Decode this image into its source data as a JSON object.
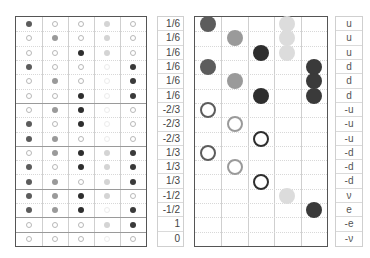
{
  "colors": {
    "col1": "#5c5c5c",
    "col2": "#9a9a9a",
    "col3": "#2e2e2e",
    "col4": "#d4d4d4",
    "col5": "#3a3a3a",
    "hollow_small": "#b8b8b8",
    "hollow_faint": "#ececec"
  },
  "left_grid": {
    "groups": [
      6,
      3,
      3,
      2,
      1,
      1
    ],
    "rows": [
      [
        1,
        0,
        0,
        1,
        0
      ],
      [
        0,
        1,
        0,
        1,
        0
      ],
      [
        0,
        0,
        1,
        1,
        0
      ],
      [
        1,
        0,
        0,
        0,
        1
      ],
      [
        0,
        1,
        0,
        0,
        1
      ],
      [
        0,
        0,
        1,
        0,
        1
      ],
      [
        0,
        1,
        1,
        0,
        0
      ],
      [
        1,
        0,
        1,
        0,
        0
      ],
      [
        1,
        1,
        0,
        0,
        0
      ],
      [
        0,
        1,
        1,
        1,
        1
      ],
      [
        1,
        0,
        1,
        1,
        1
      ],
      [
        1,
        1,
        0,
        1,
        1
      ],
      [
        1,
        1,
        1,
        1,
        0
      ],
      [
        1,
        1,
        1,
        0,
        1
      ],
      [
        0,
        0,
        0,
        1,
        1
      ],
      [
        0,
        0,
        0,
        0,
        0
      ]
    ]
  },
  "charges": [
    "1/6",
    "1/6",
    "1/6",
    "1/6",
    "1/6",
    "1/6",
    "-2/3",
    "-2/3",
    "-2/3",
    "1/3",
    "1/3",
    "1/3",
    "-1/2",
    "-1/2",
    "1",
    "0"
  ],
  "right_grid": {
    "comment_free": true,
    "rows": [
      {
        "col": 0,
        "type": "fill",
        "color": "#5c5c5c",
        "col4_extra": "#dcdcdc"
      },
      {
        "col": 1,
        "type": "fill",
        "color": "#9a9a9a",
        "col4_extra": "#dcdcdc"
      },
      {
        "col": 2,
        "type": "fill",
        "color": "#2e2e2e",
        "col4_extra": "#dcdcdc"
      },
      {
        "col": 0,
        "type": "fill",
        "color": "#5c5c5c",
        "col5_extra": "#3a3a3a"
      },
      {
        "col": 1,
        "type": "fill",
        "color": "#9a9a9a",
        "col5_extra": "#3a3a3a"
      },
      {
        "col": 2,
        "type": "fill",
        "color": "#2e2e2e",
        "col5_extra": "#3a3a3a"
      },
      {
        "col": 0,
        "type": "ring",
        "color": "#5c5c5c"
      },
      {
        "col": 1,
        "type": "ring",
        "color": "#9a9a9a"
      },
      {
        "col": 2,
        "type": "ring",
        "color": "#2e2e2e"
      },
      {
        "col": 0,
        "type": "ring",
        "color": "#5c5c5c"
      },
      {
        "col": 1,
        "type": "ring",
        "color": "#9a9a9a"
      },
      {
        "col": 2,
        "type": "ring",
        "color": "#2e2e2e"
      },
      {
        "col": 3,
        "type": "fill",
        "color": "#dcdcdc"
      },
      {
        "col": 4,
        "type": "fill",
        "color": "#3a3a3a"
      },
      {
        "col": -1,
        "type": "none",
        "color": ""
      },
      {
        "col": -1,
        "type": "none",
        "color": ""
      }
    ]
  },
  "particle_labels": [
    "u",
    "u",
    "u",
    "d",
    "d",
    "d",
    "-u",
    "-u",
    "-u",
    "-d",
    "-d",
    "-d",
    "ν",
    "e",
    "-e",
    "-ν"
  ]
}
